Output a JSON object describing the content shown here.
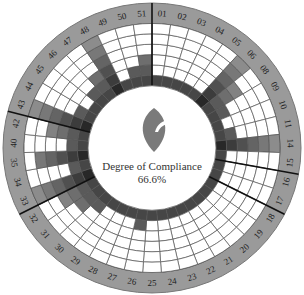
{
  "center": {
    "title": "Degree of Compliance",
    "value": "66.6%",
    "icon": "leaf-logo-icon"
  },
  "colors": {
    "ring": "#9a9a9a",
    "grid": "#555555",
    "bar_dark": "#2a2a2a",
    "bar_light": "#d8d8d8",
    "cell": "#ffffff"
  },
  "chart_data": {
    "type": "radial-bar",
    "title": "Degree of Compliance",
    "annotation": "66.6%",
    "rings": 6,
    "categories": [
      "01",
      "02",
      "03",
      "04",
      "05",
      "06",
      "08",
      "09",
      "10",
      "11",
      "14",
      "15",
      "16",
      "17",
      "18",
      "19",
      "20",
      "21",
      "22",
      "23",
      "24",
      "25",
      "26",
      "27",
      "28",
      "29",
      "30",
      "31",
      "32",
      "33",
      "34",
      "35",
      "40",
      "42",
      "43",
      "44",
      "45",
      "46",
      "47",
      "48",
      "49",
      "50",
      "51"
    ],
    "values": [
      1,
      1,
      1,
      1,
      1,
      6,
      4,
      2,
      1,
      2,
      6,
      1,
      1,
      1,
      1,
      1,
      1,
      1,
      1,
      1,
      1,
      1,
      2,
      1,
      1,
      1,
      2,
      3,
      4,
      6,
      2,
      5,
      2,
      4,
      6,
      2,
      1,
      2,
      3,
      6,
      1,
      2,
      3
    ],
    "group_separators_before": [
      "01",
      "16",
      "18",
      "33",
      "43"
    ]
  }
}
